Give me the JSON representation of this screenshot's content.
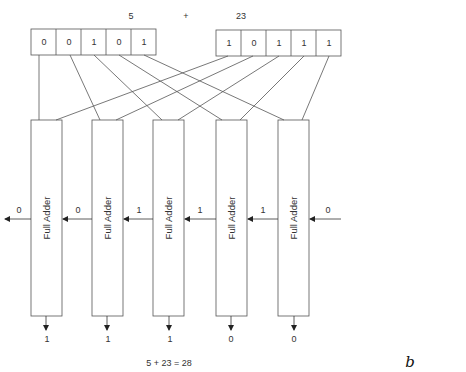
{
  "operands": {
    "a": {
      "label": "5",
      "bits": [
        "0",
        "0",
        "1",
        "0",
        "1"
      ]
    },
    "op": "+",
    "b": {
      "label": "23",
      "bits": [
        "1",
        "0",
        "1",
        "1",
        "1"
      ]
    }
  },
  "adders": [
    {
      "label": "Full Adder",
      "carry_out": "0",
      "sum": "1"
    },
    {
      "label": "Full Adder",
      "carry_out": "0",
      "sum": "1"
    },
    {
      "label": "Full Adder",
      "carry_out": "1",
      "sum": "1"
    },
    {
      "label": "Full Adder",
      "carry_out": "1",
      "sum": "0"
    },
    {
      "label": "Full Adder",
      "carry_out": "1",
      "sum": "0"
    }
  ],
  "carry_in": "0",
  "equation": "5 + 23 = 28",
  "figure_label": "b",
  "colors": {
    "line": "#555555",
    "text": "#333333",
    "background": "#ffffff"
  }
}
